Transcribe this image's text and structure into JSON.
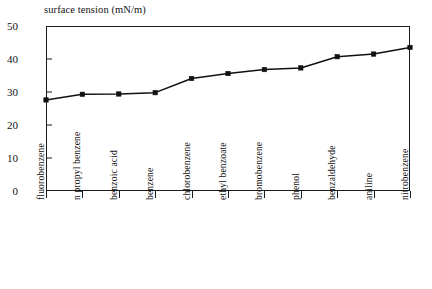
{
  "chart_data": {
    "type": "line",
    "title": "surface tension (mN/m)",
    "xlabel": "",
    "ylabel": "",
    "ylim": [
      0,
      50
    ],
    "yticks": [
      0,
      10,
      20,
      30,
      40,
      50
    ],
    "grid": false,
    "legend": "none",
    "marker": "filled-square",
    "categories": [
      "fluorobenzene",
      "n propyl benzene",
      "benzoic acid",
      "benzene",
      "chlorobenzene",
      "ethyl benzoate",
      "bromobenzene",
      "phenol",
      "benzaldehyde",
      "aniline",
      "nitrobenzene"
    ],
    "values": [
      27.6,
      29.3,
      29.4,
      29.8,
      34.1,
      35.6,
      36.8,
      37.3,
      40.7,
      41.5,
      43.5
    ],
    "series": [
      {
        "name": "surface tension",
        "values": [
          27.6,
          29.3,
          29.4,
          29.8,
          34.1,
          35.6,
          36.8,
          37.3,
          40.7,
          41.5,
          43.5
        ]
      }
    ]
  }
}
